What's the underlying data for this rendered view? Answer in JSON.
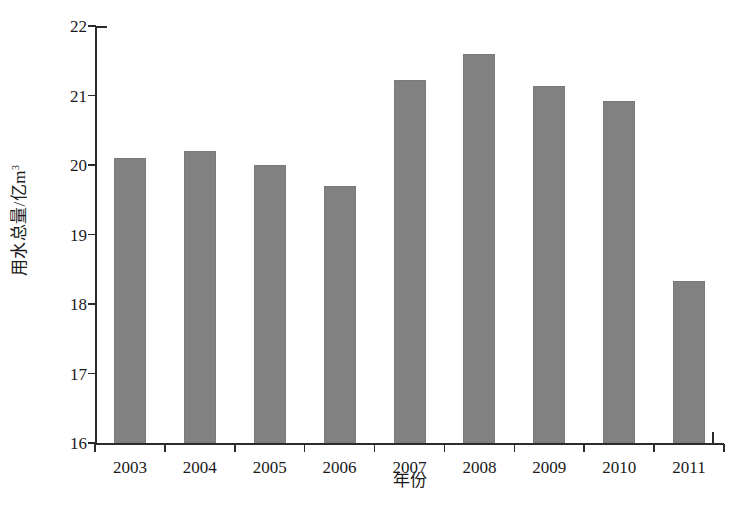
{
  "chart_data": {
    "type": "bar",
    "title": "",
    "xlabel": "年份",
    "ylabel": "用水总量/亿m³",
    "ylabel_main": "用水总量/亿m",
    "ylabel_sup": "3",
    "categories": [
      "2003",
      "2004",
      "2005",
      "2006",
      "2007",
      "2008",
      "2009",
      "2010",
      "2011"
    ],
    "values": [
      20.1,
      20.2,
      20.0,
      19.7,
      21.23,
      21.6,
      21.14,
      20.92,
      18.33
    ],
    "ylim": [
      16,
      22
    ],
    "yticks": [
      16,
      17,
      18,
      19,
      20,
      21,
      22
    ],
    "ytick_labels": [
      "16",
      "17",
      "18",
      "19",
      "20",
      "21",
      "22"
    ],
    "grid": false,
    "legend": false,
    "bar_color": "#818181",
    "axis_color": "#2b2b2b"
  }
}
